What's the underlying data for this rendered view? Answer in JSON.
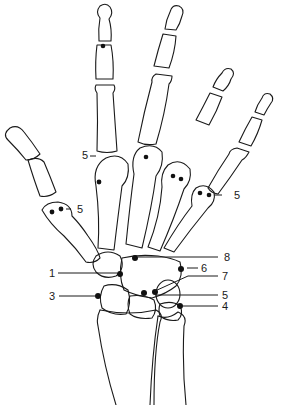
{
  "diagram": {
    "type": "anatomical line drawing",
    "colors": {
      "line": "#1a1a1a",
      "background": "#ffffff",
      "marker": "#111111"
    },
    "labels": [
      {
        "id": "label-5-index",
        "text": "5"
      },
      {
        "id": "label-5-thumb",
        "text": "5"
      },
      {
        "id": "label-5-ring",
        "text": "5"
      },
      {
        "id": "label-8",
        "text": "8"
      },
      {
        "id": "label-6",
        "text": "6"
      },
      {
        "id": "label-7",
        "text": "7"
      },
      {
        "id": "label-1",
        "text": "1"
      },
      {
        "id": "label-5-carpal",
        "text": "5"
      },
      {
        "id": "label-3",
        "text": "3"
      },
      {
        "id": "label-4",
        "text": "4"
      }
    ]
  }
}
